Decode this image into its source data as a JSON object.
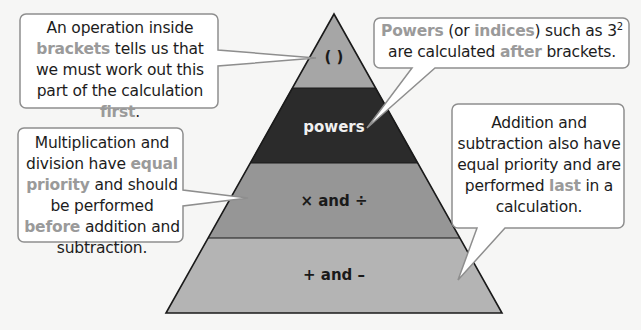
{
  "colors": {
    "background": "#f6f6f5",
    "tier_brackets": "#a6a6a6",
    "tier_powers": "#2b2b2b",
    "tier_mult_div": "#969696",
    "tier_add_sub": "#b4b4b4",
    "highlight_text": "#9a9a9a",
    "bubble_border": "#8e8e8e"
  },
  "pyramid": {
    "tiers": [
      {
        "label": "( )",
        "rank": 1
      },
      {
        "label": "powers",
        "rank": 2
      },
      {
        "label": "× and ÷",
        "rank": 3
      },
      {
        "label": "+ and –",
        "rank": 4
      }
    ]
  },
  "callouts": {
    "brackets": {
      "t1": "An operation inside ",
      "h1": "brackets",
      "t2": " tells us that we must work out this part of the calculation ",
      "h2": "first",
      "t3": "."
    },
    "powers": {
      "h1": "Powers",
      "t1": " (or ",
      "h2": "indices",
      "t2": ") such as 3",
      "sup": "2",
      "t3": " are calculated ",
      "h3": "after",
      "t4": " brackets."
    },
    "mult_div": {
      "t1": "Multiplication and division have ",
      "h1": "equal priority",
      "t2": " and should be performed ",
      "h2": "before",
      "t3": " addition and subtraction."
    },
    "add_sub": {
      "t1": "Addition and subtraction also have equal priority and are performed ",
      "h1": "last",
      "t2": " in a calculation."
    }
  }
}
